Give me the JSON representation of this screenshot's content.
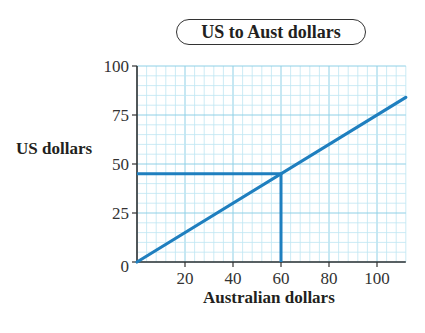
{
  "chart_data": {
    "type": "line",
    "title": "US to Aust dollars",
    "xlabel": "Australian dollars",
    "ylabel": "US dollars",
    "xlim": [
      0,
      112
    ],
    "ylim": [
      0,
      100
    ],
    "x_ticks": [
      20,
      40,
      60,
      80,
      100
    ],
    "y_ticks": [
      0,
      25,
      50,
      75,
      100
    ],
    "grid": true,
    "grid_minor_step_x": 4,
    "grid_minor_step_y": 5,
    "series": [
      {
        "name": "conversion",
        "x": [
          0,
          112
        ],
        "y": [
          0,
          84
        ],
        "color": "#1f7fbf"
      }
    ],
    "annotations": [
      {
        "type": "reading-line",
        "description": "60 Australian dollars reads 45 US dollars",
        "x": 60,
        "y": 45
      }
    ],
    "colors": {
      "line": "#1f7fbf",
      "grid_minor": "#bfe6f2",
      "grid_major": "#8fd0e6",
      "axis": "#333333"
    }
  },
  "labels": {
    "title": "US to Aust dollars",
    "xlabel": "Australian dollars",
    "ylabel": "US dollars"
  }
}
